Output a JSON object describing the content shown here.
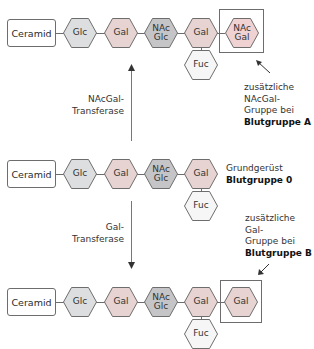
{
  "colors": {
    "glc": "#dcdedf",
    "gal": "#e6d3d2",
    "nacglc": "#c5c5c7",
    "nacgal": "#efd2d1",
    "fuc": "#f6f6f7",
    "stroke": "#6d6d6d"
  },
  "rows": [
    {
      "id": "blood-group-a",
      "ceramid": "Ceramid",
      "chain": [
        {
          "line1": "Glc",
          "line2": "",
          "type": "glc"
        },
        {
          "line1": "Gal",
          "line2": "",
          "type": "gal"
        },
        {
          "line1": "NAc",
          "line2": "Glc",
          "type": "nacglc"
        },
        {
          "line1": "Gal",
          "line2": "",
          "type": "gal"
        }
      ],
      "branch": {
        "line1": "Fuc",
        "type": "fuc"
      },
      "extra": {
        "line1": "NAc",
        "line2": "Gal",
        "type": "nacgal"
      }
    },
    {
      "id": "blood-group-0",
      "ceramid": "Ceramid",
      "chain": [
        {
          "line1": "Glc",
          "line2": "",
          "type": "glc"
        },
        {
          "line1": "Gal",
          "line2": "",
          "type": "gal"
        },
        {
          "line1": "NAc",
          "line2": "Glc",
          "type": "nacglc"
        },
        {
          "line1": "Gal",
          "line2": "",
          "type": "gal"
        }
      ],
      "branch": {
        "line1": "Fuc",
        "type": "fuc"
      }
    },
    {
      "id": "blood-group-b",
      "ceramid": "Ceramid",
      "chain": [
        {
          "line1": "Glc",
          "line2": "",
          "type": "glc"
        },
        {
          "line1": "Gal",
          "line2": "",
          "type": "gal"
        },
        {
          "line1": "NAc",
          "line2": "Glc",
          "type": "nacglc"
        },
        {
          "line1": "Gal",
          "line2": "",
          "type": "gal"
        }
      ],
      "branch": {
        "line1": "Fuc",
        "type": "fuc"
      },
      "extra": {
        "line1": "Gal",
        "line2": "",
        "type": "gal"
      }
    }
  ],
  "enzymes": {
    "a": {
      "line1": "NAcGal-",
      "line2": "Transferase"
    },
    "b": {
      "line1": "Gal-",
      "line2": "Transferase"
    }
  },
  "notes": {
    "a": {
      "line1": "zusätzliche",
      "line2": "NAcGal-",
      "line3": "Gruppe bei",
      "bold": "Blutgruppe A"
    },
    "zero": {
      "line1": "Grundgerüst",
      "bold": "Blutgruppe 0"
    },
    "b": {
      "line1": "zusätzliche",
      "line2": "Gal-",
      "line3": "Gruppe bei",
      "bold": "Blutgruppe B"
    }
  }
}
